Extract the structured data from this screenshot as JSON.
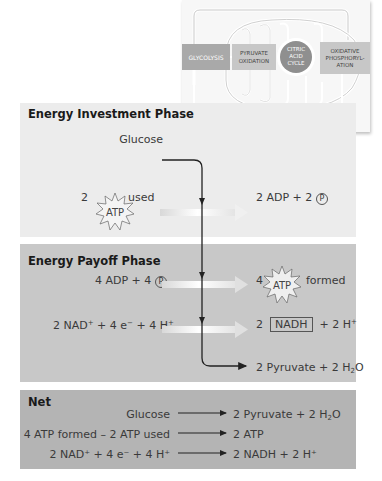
{
  "overview": {
    "stages": [
      {
        "label": "GLYCOLYSIS",
        "color": "#a9a9a9"
      },
      {
        "label": "PYRUVATE OXIDATION",
        "color": "#c7c7c7"
      },
      {
        "label": "CITRIC ACID CYCLE",
        "color": "#8f8f8f"
      },
      {
        "label": "OXIDATIVE PHOSPHORYL- ATION",
        "color": "#c7c7c7"
      }
    ],
    "atp_label": "ATP"
  },
  "investment": {
    "title": "Energy Investment Phase",
    "glucose": "Glucose",
    "atp_coef": "2",
    "atp_label": "ATP",
    "atp_used": "used",
    "product": "2 ADP + 2",
    "p_symbol": "P"
  },
  "payoff": {
    "title": "Energy Payoff Phase",
    "adp_reactant": "4 ADP + 4",
    "p_symbol": "P",
    "atp_coef": "4",
    "atp_label": "ATP",
    "atp_formed": "formed",
    "nad_reactant_pre": "2 NAD",
    "nad_reactant_post": " + 4 e",
    "nad_reactant_tail": " + 4 H",
    "nadh_coef": "2",
    "nadh_label": "NADH",
    "nadh_tail": "+ 2 H",
    "pyruvate_pre": "2 Pyruvate + 2 H",
    "pyruvate_sub": "2",
    "pyruvate_post": "O"
  },
  "net": {
    "title": "Net",
    "rows": [
      {
        "left": "Glucose",
        "right_pre": "2 Pyruvate + 2 H",
        "right_sub": "2",
        "right_post": "O"
      },
      {
        "left": "4 ATP formed – 2 ATP used",
        "right_pre": "2 ATP",
        "right_sub": "",
        "right_post": ""
      },
      {
        "left": "2 NAD⁺ + 4 e⁻ + 4 H⁺",
        "right_pre": "2 NADH + 2 H⁺",
        "right_sub": "",
        "right_post": ""
      }
    ]
  },
  "colors": {
    "investment_bg": "#ececec",
    "payoff_bg": "#c8c8c8",
    "net_bg": "#b4b4b4",
    "arrow_dark": "#222222",
    "arrow_light": "#f4f4f4"
  }
}
